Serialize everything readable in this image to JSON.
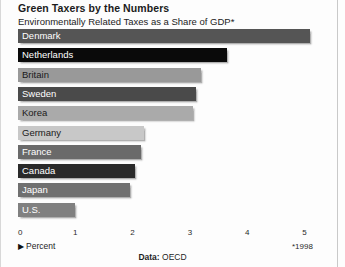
{
  "header": {
    "title": "Green Taxers by the Numbers",
    "subtitle": "Environmentally Related Taxes as a Share of GDP*"
  },
  "axis": {
    "percent_label": "Percent",
    "arrow": "▶",
    "footnote": "*1998"
  },
  "source": {
    "key": "Data:",
    "value": "OECD"
  },
  "chart_data": {
    "type": "bar",
    "orientation": "horizontal",
    "title": "Green Taxers by the Numbers",
    "subtitle": "Environmentally Related Taxes as a Share of GDP*",
    "xlabel": "Percent",
    "ylabel": "",
    "xlim": [
      0,
      5
    ],
    "xticks": [
      0,
      1,
      2,
      3,
      4,
      5
    ],
    "xtick_labels": [
      "0",
      "1",
      "2",
      "3",
      "4",
      "5"
    ],
    "grid": false,
    "legend": "none",
    "footnote": "*1998",
    "source": "Data: OECD",
    "categories": [
      "Denmark",
      "Netherlands",
      "Britain",
      "Sweden",
      "Korea",
      "Germany",
      "France",
      "Canada",
      "Japan",
      "U.S."
    ],
    "values": [
      5.1,
      3.65,
      3.2,
      3.1,
      3.05,
      2.2,
      2.15,
      2.05,
      1.95,
      1.0
    ],
    "bar_colors": [
      "#555555",
      "#0a0a0a",
      "#999999",
      "#4a4a4a",
      "#aaaaaa",
      "#c8c8c8",
      "#6a6a6a",
      "#2a2a2a",
      "#707070",
      "#808080"
    ],
    "label_colors": [
      "#ffffff",
      "#ffffff",
      "#1a1a1a",
      "#ffffff",
      "#1a1a1a",
      "#1a1a1a",
      "#ffffff",
      "#ffffff",
      "#ffffff",
      "#ffffff"
    ]
  }
}
